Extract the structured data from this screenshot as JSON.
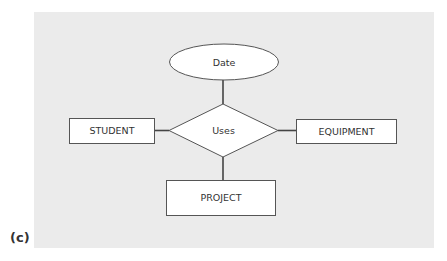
{
  "figure_label": "(c)",
  "diagram": {
    "type": "entity-relationship",
    "attribute": {
      "label": "Date"
    },
    "relationship": {
      "label": "Uses"
    },
    "entities": [
      {
        "label": "STUDENT"
      },
      {
        "label": "EQUIPMENT"
      },
      {
        "label": "PROJECT"
      }
    ]
  },
  "colors": {
    "panel_background": "#ebebeb",
    "shape_fill": "#ffffff",
    "stroke": "#444444"
  }
}
